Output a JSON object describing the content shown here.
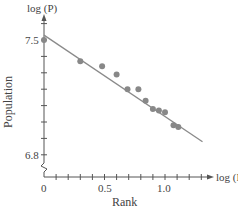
{
  "chart_data": {
    "type": "scatter",
    "title": "",
    "xlabel": "Rank",
    "ylabel": "Population",
    "x_axis_title": "log (R)",
    "y_axis_title": "log (P)",
    "x_ticks": [
      "0",
      "0.5",
      "1.0"
    ],
    "y_ticks": [
      "7.5",
      "6.8"
    ],
    "xlim": [
      0,
      1.3
    ],
    "ylim": [
      6.6,
      7.6
    ],
    "y_axis_break": true,
    "grid": false,
    "legend": null,
    "series": [
      {
        "name": "observed",
        "kind": "scatter",
        "color": "#888888",
        "x": [
          0.0,
          0.3,
          0.48,
          0.6,
          0.69,
          0.78,
          0.84,
          0.9,
          0.95,
          1.0,
          1.07,
          1.11
        ],
        "y": [
          7.5,
          7.37,
          7.34,
          7.29,
          7.2,
          7.2,
          7.13,
          7.08,
          7.07,
          7.06,
          6.98,
          6.97
        ]
      },
      {
        "name": "fit",
        "kind": "line",
        "color": "#888888",
        "x": [
          0.0,
          1.31
        ],
        "y": [
          7.53,
          6.88
        ]
      }
    ]
  },
  "labels": {
    "y_axis_title": "log (P)",
    "x_axis_title": "log (R)",
    "xlabel": "Rank",
    "ylabel": "Population",
    "ytick_top": "7.5",
    "ytick_bottom": "6.8",
    "xtick_0": "0",
    "xtick_1": "0.5",
    "xtick_2": "1.0"
  }
}
